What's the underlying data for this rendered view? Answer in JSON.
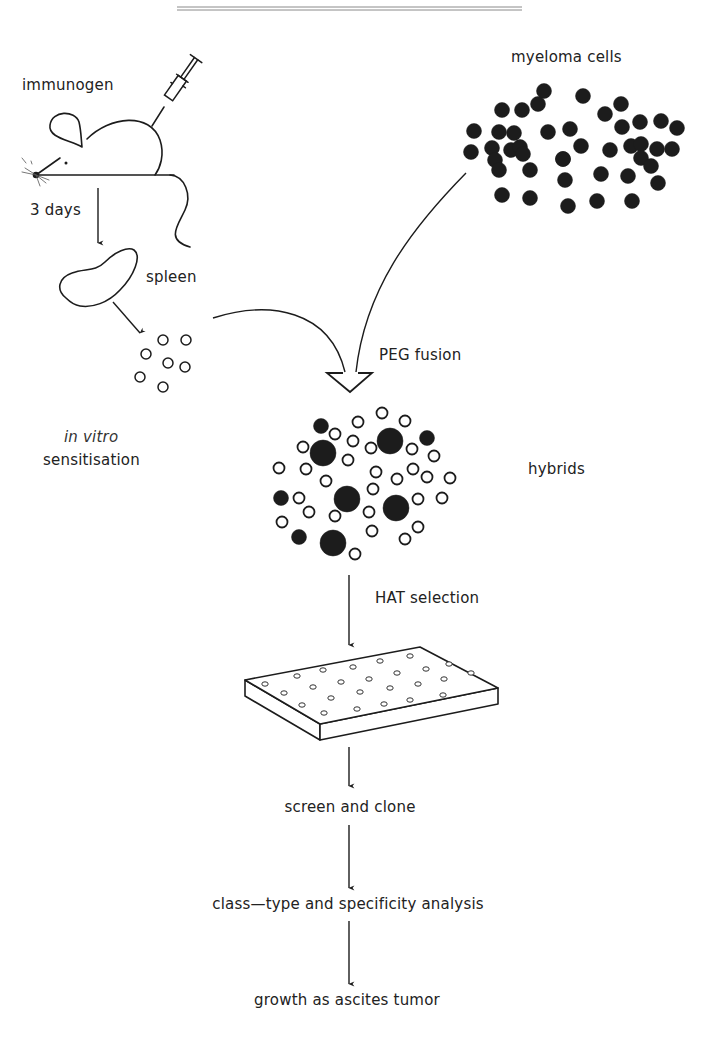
{
  "diagram": {
    "labels": {
      "immunogen": "immunogen",
      "three_days": "3 days",
      "spleen": "spleen",
      "in_vitro": "in vitro",
      "sensitisation": "sensitisation",
      "myeloma_cells": "myeloma cells",
      "peg_fusion": "PEG  fusion",
      "hybrids": "hybrids",
      "hat_selection": "HAT selection",
      "screen_and_clone": "screen and clone",
      "class_type": "class—type and specificity analysis",
      "ascites": "growth as ascites tumor"
    },
    "colors": {
      "ink": "#1c1c1c",
      "background": "#ffffff"
    },
    "steps": [
      "immunogen",
      "3 days",
      "spleen",
      "in vitro sensitisation",
      "PEG fusion",
      "hybrids",
      "HAT selection",
      "screen and clone",
      "class—type and specificity analysis",
      "growth as ascites tumor"
    ],
    "spleen_cells": [
      [
        163,
        340
      ],
      [
        186,
        340
      ],
      [
        146,
        354
      ],
      [
        168,
        363
      ],
      [
        185,
        367
      ],
      [
        140,
        377
      ],
      [
        163,
        387
      ]
    ],
    "myeloma_cells": [
      [
        544,
        91
      ],
      [
        522,
        110
      ],
      [
        538,
        104
      ],
      [
        583,
        96
      ],
      [
        502,
        110
      ],
      [
        474,
        131
      ],
      [
        499,
        132
      ],
      [
        514,
        133
      ],
      [
        548,
        132
      ],
      [
        570,
        129
      ],
      [
        605,
        114
      ],
      [
        621,
        104
      ],
      [
        622,
        127
      ],
      [
        640,
        122
      ],
      [
        661,
        121
      ],
      [
        677,
        128
      ],
      [
        471,
        152
      ],
      [
        492,
        148
      ],
      [
        511,
        150
      ],
      [
        520,
        147
      ],
      [
        523,
        154
      ],
      [
        563,
        159
      ],
      [
        581,
        146
      ],
      [
        610,
        150
      ],
      [
        631,
        146
      ],
      [
        641,
        144
      ],
      [
        657,
        149
      ],
      [
        672,
        149
      ],
      [
        495,
        160
      ],
      [
        499,
        170
      ],
      [
        530,
        170
      ],
      [
        563,
        159
      ],
      [
        565,
        180
      ],
      [
        601,
        174
      ],
      [
        628,
        176
      ],
      [
        641,
        158
      ],
      [
        651,
        166
      ],
      [
        658,
        183
      ],
      [
        502,
        195
      ],
      [
        530,
        198
      ],
      [
        568,
        206
      ],
      [
        597,
        201
      ],
      [
        632,
        201
      ]
    ],
    "hybrid_cells": {
      "large_filled": [
        [
          323,
          453
        ],
        [
          390,
          441
        ],
        [
          347,
          499
        ],
        [
          396,
          508
        ],
        [
          333,
          543
        ]
      ],
      "small_filled": [
        [
          321,
          426
        ],
        [
          427,
          438
        ],
        [
          281,
          498
        ],
        [
          299,
          537
        ]
      ],
      "open": [
        [
          382,
          413
        ],
        [
          358,
          422
        ],
        [
          405,
          421
        ],
        [
          335,
          434
        ],
        [
          353,
          441
        ],
        [
          303,
          447
        ],
        [
          371,
          448
        ],
        [
          412,
          449
        ],
        [
          434,
          456
        ],
        [
          348,
          460
        ],
        [
          279,
          468
        ],
        [
          306,
          469
        ],
        [
          376,
          472
        ],
        [
          413,
          469
        ],
        [
          397,
          479
        ],
        [
          427,
          477
        ],
        [
          450,
          478
        ],
        [
          326,
          481
        ],
        [
          373,
          489
        ],
        [
          299,
          498
        ],
        [
          418,
          499
        ],
        [
          442,
          498
        ],
        [
          309,
          512
        ],
        [
          335,
          516
        ],
        [
          369,
          512
        ],
        [
          282,
          522
        ],
        [
          372,
          531
        ],
        [
          418,
          527
        ],
        [
          405,
          539
        ],
        [
          355,
          554
        ]
      ]
    },
    "plate_wells": [
      [
        265,
        684
      ],
      [
        297,
        676
      ],
      [
        323,
        670
      ],
      [
        353,
        667
      ],
      [
        380,
        661
      ],
      [
        410,
        656
      ],
      [
        284,
        693
      ],
      [
        313,
        687
      ],
      [
        341,
        682
      ],
      [
        369,
        679
      ],
      [
        397,
        673
      ],
      [
        426,
        669
      ],
      [
        449,
        664
      ],
      [
        302,
        705
      ],
      [
        331,
        698
      ],
      [
        360,
        692
      ],
      [
        390,
        688
      ],
      [
        418,
        684
      ],
      [
        444,
        679
      ],
      [
        471,
        673
      ],
      [
        324,
        713
      ],
      [
        357,
        709
      ],
      [
        384,
        704
      ],
      [
        410,
        700
      ],
      [
        443,
        695
      ]
    ]
  }
}
